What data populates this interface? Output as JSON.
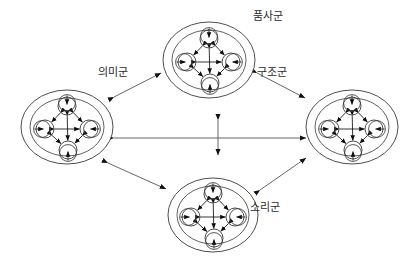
{
  "figure": {
    "kind": "node-cluster-network-diagram",
    "background_color": "#ffffff",
    "stroke_color": "#3a3a3a",
    "arrow_color": "#111111",
    "label_color": "#2b2b2b",
    "canvas": {
      "width": 418,
      "height": 263
    }
  },
  "clusters": [
    {
      "id": "top",
      "label": "품사군",
      "label_x": 268,
      "label_y": 17,
      "cx": 209,
      "cy": 60,
      "rx": 46,
      "ry": 38,
      "inner_rx": 37,
      "inner_ry": 30,
      "node_count": 4,
      "node_radius": 9,
      "node_offset": 20
    },
    {
      "id": "left",
      "label": "의미군",
      "label_x": 113,
      "label_y": 73,
      "cx": 67,
      "cy": 127,
      "rx": 46,
      "ry": 37,
      "inner_rx": 37,
      "inner_ry": 29,
      "node_count": 4,
      "node_radius": 9,
      "node_offset": 20
    },
    {
      "id": "right",
      "label": "구조군",
      "label_x": 272,
      "label_y": 73,
      "cx": 352,
      "cy": 127,
      "rx": 46,
      "ry": 37,
      "inner_rx": 37,
      "inner_ry": 29,
      "node_count": 4,
      "node_radius": 9,
      "node_offset": 20
    },
    {
      "id": "bottom",
      "label": "소리군",
      "label_x": 265,
      "label_y": 208,
      "cx": 213,
      "cy": 215,
      "rx": 45,
      "ry": 37,
      "inner_rx": 36,
      "inner_ry": 29,
      "node_count": 4,
      "node_radius": 9,
      "node_offset": 20
    }
  ],
  "connections": [
    {
      "id": "left-top",
      "from": "left",
      "to": "top",
      "x1": 114,
      "y1": 97,
      "x2": 161,
      "y2": 73,
      "bidirectional": true
    },
    {
      "id": "top-right",
      "from": "top",
      "to": "right",
      "x1": 257,
      "y1": 73,
      "x2": 305,
      "y2": 98,
      "bidirectional": true
    },
    {
      "id": "left-bottom",
      "from": "left",
      "to": "bottom",
      "x1": 108,
      "y1": 163,
      "x2": 166,
      "y2": 189,
      "bidirectional": true
    },
    {
      "id": "bottom-right",
      "from": "bottom",
      "to": "right",
      "x1": 260,
      "y1": 190,
      "x2": 306,
      "y2": 158,
      "bidirectional": true
    },
    {
      "id": "left-right",
      "from": "left",
      "to": "right",
      "x1": 114,
      "y1": 138,
      "x2": 306,
      "y2": 138,
      "bidirectional": true
    },
    {
      "id": "top-bottom",
      "from": "top",
      "to": "bottom",
      "x1": 218,
      "y1": 120,
      "x2": 218,
      "y2": 155,
      "bidirectional": true
    }
  ],
  "cluster_internal": {
    "description": "Each cluster holds four nodes in a diamond arrangement; every node carries an outward self-loop arrow and the nodes are joined by bidirectional arrows.",
    "node_positions": [
      "top",
      "left",
      "right",
      "bottom"
    ],
    "self_loops": true,
    "internal_links_bidirectional": true,
    "internal_link_pairs": [
      [
        "top",
        "left"
      ],
      [
        "top",
        "right"
      ],
      [
        "top",
        "bottom"
      ],
      [
        "left",
        "right"
      ],
      [
        "left",
        "bottom"
      ],
      [
        "right",
        "bottom"
      ]
    ]
  }
}
